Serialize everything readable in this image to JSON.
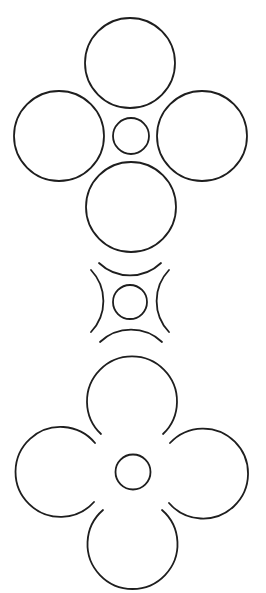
{
  "canvas": {
    "width": 266,
    "height": 593,
    "background": "#ffffff",
    "stroke_color": "#1e1e1e",
    "stroke_width": 1.8
  },
  "figures": [
    {
      "name": "four-circles-around-small-circle",
      "center_circle": {
        "cx": 131,
        "cy": 136,
        "r": 18
      },
      "outer_circles": [
        {
          "position": "top",
          "cx": 130,
          "cy": 63,
          "r": 45
        },
        {
          "position": "left",
          "cx": 59,
          "cy": 136,
          "r": 45
        },
        {
          "position": "right",
          "cx": 202,
          "cy": 136,
          "r": 45
        },
        {
          "position": "bottom",
          "cx": 131,
          "cy": 207,
          "r": 45
        }
      ]
    },
    {
      "name": "concave-arcs-around-small-circle",
      "center_circle": {
        "cx": 130,
        "cy": 302,
        "r": 17
      },
      "arcs": [
        {
          "position": "top",
          "d": "M 99 263 A 45 45 0 0 0 161 263"
        },
        {
          "position": "left",
          "d": "M 91 270 A 45 45 0 0 1 91 332"
        },
        {
          "position": "right",
          "d": "M 169 270 A 45 45 0 0 0 169 332"
        },
        {
          "position": "bottom",
          "d": "M 100 342 A 45 45 0 0 1 162 342"
        }
      ]
    },
    {
      "name": "flower-with-open-petals",
      "center_circle": {
        "cx": 133,
        "cy": 472,
        "r": 17.5
      },
      "petals": [
        {
          "position": "top",
          "d": "M 101 434 A 45 45 0 1 1 163 434"
        },
        {
          "position": "left",
          "d": "M 95 443 A 45 45 0 1 0 94 502"
        },
        {
          "position": "right",
          "d": "M 170 443 A 45 45 0 1 1 169 503"
        },
        {
          "position": "bottom",
          "d": "M 103 510 A 45 45 0 1 0 162 510"
        }
      ]
    }
  ]
}
